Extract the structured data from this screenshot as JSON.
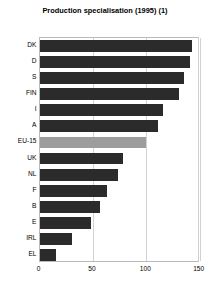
{
  "chart_data": {
    "type": "bar",
    "orientation": "horizontal",
    "title": "Production specialisation (1995) (1)",
    "xlabel": "",
    "ylabel": "",
    "xlim": [
      0,
      150
    ],
    "xticks": [
      0,
      50,
      100,
      150
    ],
    "grid": true,
    "legend": "none",
    "categories": [
      "DK",
      "D",
      "S",
      "FIN",
      "I",
      "A",
      "EU-15",
      "UK",
      "NL",
      "F",
      "B",
      "E",
      "IRL",
      "EL"
    ],
    "values": [
      143,
      141,
      135,
      131,
      116,
      111,
      100,
      78,
      73,
      63,
      57,
      48,
      30,
      15
    ],
    "highlight_category": "EU-15",
    "colors": {
      "bar": "#2b2b2b",
      "highlight_bar": "#9d9d9d",
      "grid": "#d2d2d2",
      "axis": "#b9b9b9",
      "text": "#000000",
      "background": "#ffffff"
    }
  }
}
